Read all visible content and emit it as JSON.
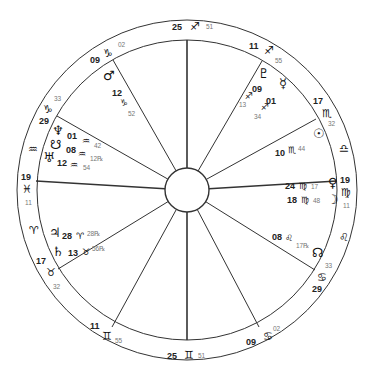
{
  "chart": {
    "center": [
      187,
      190
    ],
    "outer_radius": 170,
    "inner_radius": 150,
    "hub_radius": 22,
    "line_color": "#333333"
  },
  "house_cusps": [
    {
      "name": "cusp-10",
      "x": 187,
      "y": 40,
      "deg": "25",
      "sign": "♐",
      "min": "51",
      "label": [
        172,
        30
      ],
      "symbol": [
        190,
        30
      ],
      "minpos": [
        206,
        29
      ]
    },
    {
      "name": "cusp-11",
      "x": 262,
      "y": 61,
      "deg": "11",
      "sign": "♐",
      "min": "55",
      "label": [
        249,
        49
      ],
      "symbol": [
        264,
        54
      ],
      "minpos": [
        275,
        63
      ]
    },
    {
      "name": "cusp-12",
      "x": 316,
      "y": 119,
      "deg": "17",
      "sign": "♏",
      "min": "32",
      "label": [
        313,
        104
      ],
      "symbol": [
        322,
        117
      ],
      "minpos": [
        328,
        126
      ]
    },
    {
      "name": "cusp-1",
      "x": 337,
      "y": 181,
      "deg": "19",
      "sign": "♍",
      "min": "11",
      "label": [
        340,
        183
      ],
      "symbol": [
        341,
        196
      ],
      "minpos": [
        343,
        208
      ]
    },
    {
      "name": "cusp-2",
      "x": 315,
      "y": 270,
      "deg": "29",
      "sign": "♋",
      "min": "33",
      "label": [
        312,
        292
      ],
      "symbol": [
        317,
        281
      ],
      "minpos": [
        325,
        268
      ]
    },
    {
      "name": "cusp-3",
      "x": 259,
      "y": 327,
      "deg": "09",
      "sign": "♋",
      "min": "02",
      "label": [
        246,
        345
      ],
      "symbol": [
        263,
        340
      ],
      "minpos": [
        273,
        331
      ]
    },
    {
      "name": "cusp-4",
      "x": 187,
      "y": 340,
      "deg": "25",
      "sign": "♊",
      "min": "51",
      "label": [
        167,
        359
      ],
      "symbol": [
        184,
        359
      ],
      "minpos": [
        198,
        358
      ]
    },
    {
      "name": "cusp-5",
      "x": 112,
      "y": 327,
      "deg": "11",
      "sign": "♊",
      "min": "55",
      "label": [
        90,
        329
      ],
      "symbol": [
        102,
        340
      ],
      "minpos": [
        115,
        343
      ]
    },
    {
      "name": "cusp-6",
      "x": 58,
      "y": 269,
      "deg": "17",
      "sign": "♉",
      "min": "32",
      "label": [
        36,
        264
      ],
      "symbol": [
        46,
        276
      ],
      "minpos": [
        53,
        289
      ]
    },
    {
      "name": "cusp-7",
      "x": 36,
      "y": 181,
      "deg": "19",
      "sign": "♓",
      "min": "11",
      "label": [
        21,
        180
      ],
      "symbol": [
        22,
        193
      ],
      "minpos": [
        25,
        205
      ]
    },
    {
      "name": "cusp-8",
      "x": 57,
      "y": 116,
      "deg": "29",
      "sign": "♑",
      "min": "33",
      "label": [
        39,
        124
      ],
      "symbol": [
        43,
        113
      ],
      "minpos": [
        54,
        101
      ]
    },
    {
      "name": "cusp-9",
      "x": 113,
      "y": 60,
      "deg": "09",
      "sign": "♑",
      "min": "02",
      "label": [
        90,
        63
      ],
      "symbol": [
        103,
        57
      ],
      "minpos": [
        118,
        47
      ]
    }
  ],
  "ring_signs": [
    {
      "name": "aquarius-ring",
      "sign": "♒",
      "x": 28,
      "y": 153
    },
    {
      "name": "libra-ring",
      "sign": "♎",
      "x": 339,
      "y": 152
    },
    {
      "name": "leo-ring",
      "sign": "♌",
      "x": 339,
      "y": 241
    },
    {
      "name": "aries-ring",
      "sign": "♈",
      "x": 29,
      "y": 234
    }
  ],
  "planets": [
    {
      "name": "mars",
      "glyph": "♂",
      "x": 103,
      "y": 80,
      "deg": "12",
      "sign": "♑",
      "min": "52",
      "dx": [
        112,
        96
      ],
      "sx": [
        120,
        106
      ],
      "mx": [
        128,
        116
      ]
    },
    {
      "name": "neptune",
      "glyph": "♆",
      "x": 52,
      "y": 135,
      "deg": "01",
      "sign": "♒",
      "min": "42",
      "dx": [
        67,
        139
      ],
      "sx": [
        82,
        144
      ],
      "mx": [
        94,
        148
      ]
    },
    {
      "name": "north-node-south",
      "glyph": "☋",
      "x": 50,
      "y": 149,
      "deg": "08",
      "sign": "♒",
      "min": "12℞",
      "dx": [
        66,
        153
      ],
      "sx": [
        78,
        157
      ],
      "mx": [
        90,
        161
      ]
    },
    {
      "name": "uranus",
      "glyph": "♅",
      "x": 43,
      "y": 162,
      "deg": "12",
      "sign": "♒",
      "min": "54",
      "dx": [
        57,
        166
      ],
      "sx": [
        70,
        168
      ],
      "mx": [
        83,
        170
      ]
    },
    {
      "name": "pluto",
      "glyph": "♇",
      "x": 258,
      "y": 78,
      "deg": "09",
      "sign": "♐",
      "min": "13",
      "dx": [
        252,
        92
      ],
      "sx": [
        245,
        99
      ],
      "mx": [
        239,
        107
      ]
    },
    {
      "name": "mercury",
      "glyph": "☿",
      "x": 279,
      "y": 88,
      "deg": "01",
      "sign": "♐",
      "min": "34",
      "dx": [
        266,
        104
      ],
      "sx": [
        261,
        110
      ],
      "mx": [
        254,
        119
      ]
    },
    {
      "name": "sun",
      "glyph": "☉",
      "x": 313,
      "y": 138,
      "deg": "10",
      "sign": "♏",
      "min": "44",
      "dx": [
        275,
        156
      ],
      "sx": [
        288,
        153
      ],
      "mx": [
        298,
        151
      ]
    },
    {
      "name": "venus",
      "glyph": "♀",
      "x": 328,
      "y": 187,
      "deg": "24",
      "sign": "♍",
      "min": "17",
      "dx": [
        285,
        189
      ],
      "sx": [
        299,
        189
      ],
      "mx": [
        311,
        189
      ]
    },
    {
      "name": "moon",
      "glyph": "☽",
      "x": 327,
      "y": 204,
      "deg": "18",
      "sign": "♍",
      "min": "48",
      "dx": [
        287,
        203
      ],
      "sx": [
        301,
        203
      ],
      "mx": [
        313,
        203
      ]
    },
    {
      "name": "north-node",
      "glyph": "☊",
      "x": 312,
      "y": 257,
      "deg": "08",
      "sign": "♌",
      "min": "17℞",
      "dx": [
        272,
        240
      ],
      "sx": [
        285,
        241
      ],
      "mx": [
        296,
        248
      ]
    },
    {
      "name": "jupiter",
      "glyph": "♃",
      "x": 49,
      "y": 237,
      "deg": "28",
      "sign": "♈",
      "min": "28℞",
      "dx": [
        62,
        239
      ],
      "sx": [
        76,
        239
      ],
      "mx": [
        87,
        236
      ]
    },
    {
      "name": "saturn",
      "glyph": "♄",
      "x": 52,
      "y": 256,
      "deg": "13",
      "sign": "♉",
      "min": "56℞",
      "dx": [
        68,
        256
      ],
      "sx": [
        82,
        255
      ],
      "mx": [
        92,
        251
      ]
    }
  ]
}
